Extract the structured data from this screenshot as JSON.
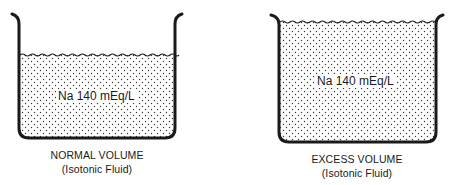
{
  "diagram": {
    "colors": {
      "ink": "#1a1a1a",
      "background": "#ffffff",
      "stipple": "#333333"
    },
    "panels": [
      {
        "id": "normal",
        "concentration_label": "Na 140 mEq/L",
        "caption_title": "NORMAL VOLUME",
        "caption_subtitle": "(Isotonic Fluid)",
        "fill_level": "partial"
      },
      {
        "id": "excess",
        "concentration_label": "Na 140 mEq/L",
        "caption_title": "EXCESS VOLUME",
        "caption_subtitle": "(Isotonic Fluid)",
        "fill_level": "full"
      }
    ]
  }
}
